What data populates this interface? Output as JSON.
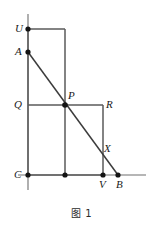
{
  "figure": {
    "caption": "图 1",
    "colors": {
      "stroke": "#5a5a5a",
      "diagonal": "#3c3c3c",
      "axis": "#6e6e6e",
      "point": "#141414",
      "label": "#1a1a1a",
      "background": "#ffffff"
    },
    "geometry": {
      "axis_vertical": {
        "x": 28,
        "y_top": 14,
        "y_bottom": 190
      },
      "axis_horizontal": {
        "y": 175,
        "x_left": 18,
        "x_right": 146
      },
      "upper_rectangle": {
        "left": 28,
        "top": 29,
        "right": 65,
        "bottom": 175
      },
      "lower_rectangle": {
        "left": 28,
        "top": 105,
        "right": 103,
        "bottom": 175
      },
      "diagonal": {
        "x1": 28,
        "y1": 52,
        "x2": 118,
        "y2": 175
      }
    },
    "points": [
      {
        "name": "U",
        "x": 28,
        "y": 29,
        "label": "U",
        "label_x": 15,
        "label_y": 23
      },
      {
        "name": "A",
        "x": 28,
        "y": 52,
        "label": "A",
        "label_x": 15,
        "label_y": 46
      },
      {
        "name": "Q",
        "x": 28,
        "y": 105,
        "label": "Q",
        "label_x": 14,
        "label_y": 99
      },
      {
        "name": "P",
        "x": 65,
        "y": 105,
        "label": "P",
        "label_x": 68,
        "label_y": 90
      },
      {
        "name": "R",
        "x": 103,
        "y": 105,
        "label": "R",
        "label_x": 106,
        "label_y": 99
      },
      {
        "name": "X",
        "x": 96,
        "y": 147,
        "label": "X",
        "label_x": 104,
        "label_y": 143
      },
      {
        "name": "C",
        "x": 28,
        "y": 175,
        "label": "C",
        "label_x": 14,
        "label_y": 169
      },
      {
        "name": "M",
        "x": 65,
        "y": 175,
        "label": "",
        "label_x": 0,
        "label_y": 0
      },
      {
        "name": "V",
        "x": 103,
        "y": 175,
        "label": "V",
        "label_x": 99,
        "label_y": 179
      },
      {
        "name": "B",
        "x": 118,
        "y": 175,
        "label": "B",
        "label_x": 116,
        "label_y": 179
      }
    ],
    "dot_radius": 2.6
  }
}
